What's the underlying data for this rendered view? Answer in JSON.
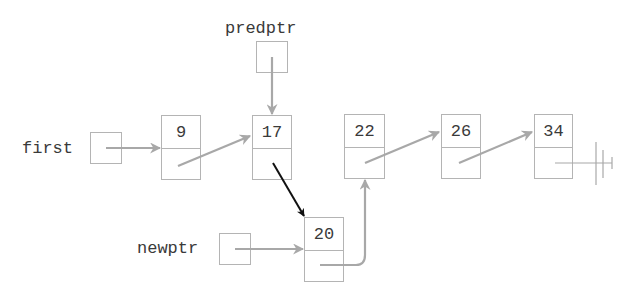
{
  "diagram": {
    "pointers": [
      {
        "id": "first",
        "label": "first"
      },
      {
        "id": "predptr",
        "label": "predptr"
      },
      {
        "id": "newptr",
        "label": "newptr"
      }
    ],
    "nodes": [
      {
        "id": "n9",
        "value": "9"
      },
      {
        "id": "n17",
        "value": "17"
      },
      {
        "id": "n22",
        "value": "22"
      },
      {
        "id": "n26",
        "value": "26"
      },
      {
        "id": "n34",
        "value": "34"
      },
      {
        "id": "n20",
        "value": "20"
      }
    ],
    "edges": [
      {
        "from": "first",
        "to": "n9",
        "color": "#a8a8a8"
      },
      {
        "from": "n9",
        "to": "n17",
        "color": "#a8a8a8"
      },
      {
        "from": "predptr",
        "to": "n17",
        "color": "#a8a8a8"
      },
      {
        "from": "n17",
        "to": "n20",
        "color": "#111111"
      },
      {
        "from": "newptr",
        "to": "n20",
        "color": "#a8a8a8"
      },
      {
        "from": "n20",
        "to": "n22",
        "color": "#a8a8a8"
      },
      {
        "from": "n22",
        "to": "n26",
        "color": "#a8a8a8"
      },
      {
        "from": "n26",
        "to": "n34",
        "color": "#a8a8a8"
      },
      {
        "from": "n34",
        "to": "null",
        "color": "#a8a8a8"
      }
    ],
    "colors": {
      "box_border": "#b4b4b4",
      "arrow": "#a8a8a8",
      "new_link_arrow": "#111111",
      "text": "#3a3a3a"
    }
  }
}
